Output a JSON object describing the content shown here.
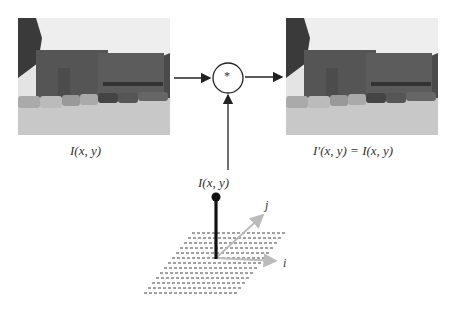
{
  "diagram": {
    "input_image": {
      "label": "I(x, y)",
      "description": "photo of brick building with parked cars"
    },
    "output_image": {
      "label": "I′(x, y) = I(x, y)",
      "description": "identical photo of brick building with parked cars"
    },
    "operator": {
      "symbol": "*",
      "meaning": "convolution"
    },
    "kernel": {
      "label": "I(x, y)",
      "description": "impulse (delta) at origin of i-j grid"
    },
    "axes": {
      "i_label": "i",
      "j_label": "j"
    },
    "colors": {
      "line": "#222222",
      "axis": "#bbbbbb",
      "grid": "#444444"
    }
  }
}
